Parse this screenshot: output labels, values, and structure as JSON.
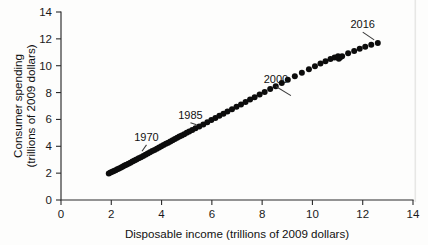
{
  "chart_data": {
    "type": "scatter",
    "title": "",
    "xlabel": "Disposable income (trillions of 2009 dollars)",
    "ylabel": "Consumer spending (trillions of 2009 dollars)",
    "ylabel_line1": "Consumer spending",
    "ylabel_line2": "(trillions of 2009 dollars)",
    "xlim": [
      0,
      14
    ],
    "ylim": [
      0,
      14
    ],
    "xticks": [
      0,
      2,
      4,
      6,
      8,
      10,
      12,
      14
    ],
    "yticks": [
      0,
      2,
      4,
      6,
      8,
      10,
      12,
      14
    ],
    "xtick_labels": [
      "0",
      "2",
      "4",
      "6",
      "8",
      "10",
      "12",
      "14"
    ],
    "ytick_labels": [
      "0",
      "2",
      "4",
      "6",
      "8",
      "10",
      "12",
      "14"
    ],
    "grid": false,
    "legend": false,
    "point_color": "#0c0c0c",
    "axis_color": "#2b2b2b",
    "series": [
      {
        "name": "Consumer spending vs disposable income",
        "x": [
          1.9,
          1.97,
          2.04,
          2.1,
          2.17,
          2.24,
          2.31,
          2.39,
          2.46,
          2.53,
          2.6,
          2.68,
          2.76,
          2.84,
          2.92,
          3.0,
          3.09,
          3.18,
          3.27,
          3.36,
          3.45,
          3.54,
          3.63,
          3.72,
          3.81,
          3.9,
          3.99,
          4.08,
          4.17,
          4.26,
          4.35,
          4.44,
          4.53,
          4.62,
          4.71,
          4.8,
          4.9,
          5.0,
          5.1,
          5.22,
          5.35,
          5.5,
          5.66,
          5.82,
          5.98,
          6.14,
          6.3,
          6.46,
          6.62,
          6.8,
          6.98,
          7.16,
          7.34,
          7.52,
          7.7,
          7.9,
          8.1,
          8.32,
          8.54,
          8.78,
          9.02,
          9.3,
          9.58,
          9.86,
          10.1,
          10.32,
          10.52,
          10.72,
          10.88,
          11.02,
          11.1,
          11.05,
          11.18,
          11.42,
          11.66,
          11.88,
          12.1,
          12.34,
          12.6
        ],
        "y": [
          1.98,
          2.04,
          2.1,
          2.16,
          2.22,
          2.29,
          2.35,
          2.42,
          2.49,
          2.56,
          2.63,
          2.7,
          2.78,
          2.86,
          2.94,
          3.02,
          3.1,
          3.19,
          3.28,
          3.37,
          3.46,
          3.55,
          3.64,
          3.73,
          3.82,
          3.91,
          4.0,
          4.09,
          4.18,
          4.27,
          4.36,
          4.45,
          4.54,
          4.63,
          4.72,
          4.81,
          4.9,
          5.0,
          5.1,
          5.21,
          5.34,
          5.48,
          5.63,
          5.79,
          5.95,
          6.11,
          6.27,
          6.43,
          6.59,
          6.76,
          6.94,
          7.12,
          7.3,
          7.48,
          7.66,
          7.85,
          8.05,
          8.26,
          8.48,
          8.72,
          8.96,
          9.22,
          9.48,
          9.74,
          9.96,
          10.16,
          10.34,
          10.5,
          10.62,
          10.7,
          10.62,
          10.52,
          10.7,
          10.92,
          11.1,
          11.26,
          11.42,
          11.56,
          11.7
        ]
      }
    ],
    "annotations": [
      {
        "label": "1970",
        "text_x": 3.4,
        "text_y": 4.4,
        "point_x": 3.15,
        "point_y": 3.32
      },
      {
        "label": "1985",
        "text_x": 5.15,
        "text_y": 6.05,
        "point_x": 5.52,
        "point_y": 5.36
      },
      {
        "label": "2000",
        "text_x": 8.55,
        "text_y": 8.75,
        "point_x": 9.28,
        "point_y": 7.55
      },
      {
        "label": "2016",
        "text_x": 12.0,
        "text_y": 12.8,
        "point_x": 12.58,
        "point_y": 11.68
      }
    ]
  }
}
